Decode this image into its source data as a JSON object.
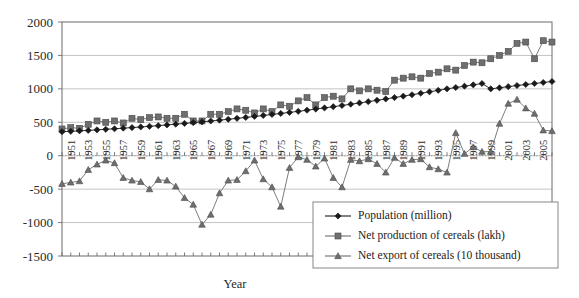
{
  "chart_data": {
    "type": "line",
    "title": "",
    "xlabel": "Year",
    "ylabel": "",
    "ylim": [
      -1500,
      2000
    ],
    "ytick_values": [
      2000,
      1500,
      1000,
      500,
      0,
      -500,
      -1000,
      -1500
    ],
    "ytick_labels": [
      "2000",
      "1500",
      "1000",
      "500",
      "0",
      "-500",
      "-1000",
      "-1500"
    ],
    "grid": "horizontal",
    "legend_position": "bottom-right",
    "x": [
      1950,
      1951,
      1952,
      1953,
      1954,
      1955,
      1956,
      1957,
      1958,
      1959,
      1960,
      1961,
      1962,
      1963,
      1964,
      1965,
      1966,
      1967,
      1968,
      1969,
      1970,
      1971,
      1972,
      1973,
      1974,
      1975,
      1976,
      1977,
      1978,
      1979,
      1980,
      1981,
      1982,
      1983,
      1984,
      1985,
      1986,
      1987,
      1988,
      1989,
      1990,
      1991,
      1992,
      1993,
      1994,
      1995,
      1996,
      1997,
      1998,
      1999,
      2000,
      2001,
      2002,
      2003,
      2004,
      2005,
      2006
    ],
    "xtick_labels": [
      "1951",
      "1953",
      "1955",
      "1957",
      "1959",
      "1961",
      "1963",
      "1965",
      "1967",
      "1969",
      "1971",
      "1973",
      "1975",
      "1977",
      "1979",
      "1981",
      "1983",
      "1985",
      "1987",
      "1989",
      "1991",
      "1993",
      "1995",
      "1997",
      "1999",
      "2001",
      "2003",
      "2005"
    ],
    "xtick_values": [
      1951,
      1953,
      1955,
      1957,
      1959,
      1961,
      1963,
      1965,
      1967,
      1969,
      1971,
      1973,
      1975,
      1977,
      1979,
      1981,
      1983,
      1985,
      1987,
      1989,
      1991,
      1993,
      1995,
      1997,
      1999,
      2001,
      2003,
      2005
    ],
    "series": [
      {
        "name": "Population (million)",
        "marker": "diamond",
        "color": "#1a1a1a",
        "values": [
          359,
          365,
          372,
          379,
          387,
          395,
          403,
          412,
          421,
          430,
          440,
          450,
          461,
          472,
          483,
          495,
          507,
          519,
          532,
          545,
          559,
          573,
          587,
          602,
          617,
          632,
          648,
          664,
          681,
          698,
          715,
          733,
          751,
          770,
          789,
          809,
          829,
          849,
          870,
          891,
          912,
          934,
          956,
          978,
          1000,
          1020,
          1040,
          1060,
          1080,
          1000,
          1016,
          1033,
          1050,
          1065,
          1080,
          1095,
          1110
        ]
      },
      {
        "name": "Net production of cereals (lakh)",
        "marker": "square",
        "color": "#6e6e6e",
        "values": [
          400,
          420,
          410,
          470,
          520,
          500,
          520,
          490,
          560,
          540,
          570,
          580,
          560,
          560,
          620,
          520,
          520,
          620,
          620,
          660,
          700,
          680,
          640,
          700,
          660,
          760,
          740,
          820,
          870,
          760,
          870,
          890,
          850,
          1000,
          970,
          1000,
          980,
          960,
          1130,
          1160,
          1180,
          1160,
          1230,
          1250,
          1300,
          1280,
          1350,
          1400,
          1390,
          1450,
          1500,
          1560,
          1680,
          1700,
          1450,
          1720,
          1700
        ]
      },
      {
        "name": "Net export of cereals (10 thousand)",
        "marker": "triangle",
        "color": "#6e6e6e",
        "values": [
          -420,
          -400,
          -380,
          -210,
          -130,
          -70,
          -110,
          -330,
          -370,
          -390,
          -500,
          -360,
          -370,
          -460,
          -630,
          -730,
          -1030,
          -880,
          -560,
          -370,
          -360,
          -230,
          -70,
          -350,
          -470,
          -760,
          -180,
          -20,
          -60,
          -160,
          -40,
          -330,
          -470,
          -60,
          -80,
          -50,
          -120,
          -250,
          -30,
          -120,
          -60,
          -50,
          -170,
          -200,
          -250,
          340,
          30,
          130,
          60,
          60,
          480,
          780,
          840,
          710,
          630,
          380,
          370
        ]
      }
    ]
  },
  "legend": {
    "items": [
      {
        "label": "Population (million)",
        "marker": "diamond",
        "color": "#1a1a1a"
      },
      {
        "label": "Net production of cereals (lakh)",
        "marker": "square",
        "color": "#6e6e6e"
      },
      {
        "label": "Net export of cereals (10 thousand)",
        "marker": "triangle",
        "color": "#6e6e6e"
      }
    ]
  },
  "axes": {
    "x_title": "Year"
  }
}
